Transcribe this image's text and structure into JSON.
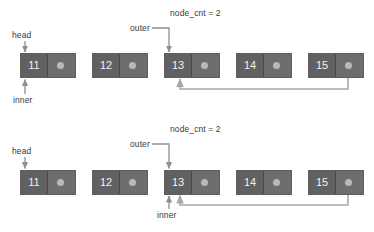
{
  "figure": {
    "background_color": "#ffffff",
    "node_fill": "#616161",
    "pointer_fill": "#6d6d6d",
    "dot_color": "#b9b9b9",
    "wire_color": "#a8a8a8",
    "text_color": "#3a3a3a",
    "node_text_color": "#f2f2f2"
  },
  "diagrams": [
    {
      "id": "top",
      "nodes": [
        {
          "value": "11"
        },
        {
          "value": "12"
        },
        {
          "value": "13"
        },
        {
          "value": "14"
        },
        {
          "value": "15"
        }
      ],
      "labels": {
        "head": "head",
        "inner": "inner",
        "outer": "outer",
        "node_cnt": "node_cnt = 2"
      },
      "pointers": {
        "head_target": "11",
        "inner_target": "11",
        "outer_target": "13",
        "back_edge_from": "15",
        "back_edge_to": "13"
      }
    },
    {
      "id": "bottom",
      "nodes": [
        {
          "value": "11"
        },
        {
          "value": "12"
        },
        {
          "value": "13"
        },
        {
          "value": "14"
        },
        {
          "value": "15"
        }
      ],
      "labels": {
        "head": "head",
        "inner": "inner",
        "outer": "outer",
        "node_cnt": "node_cnt = 2"
      },
      "pointers": {
        "head_target": "11",
        "inner_target": "13",
        "outer_target": "13",
        "back_edge_from": "15",
        "back_edge_to": "13"
      }
    }
  ]
}
